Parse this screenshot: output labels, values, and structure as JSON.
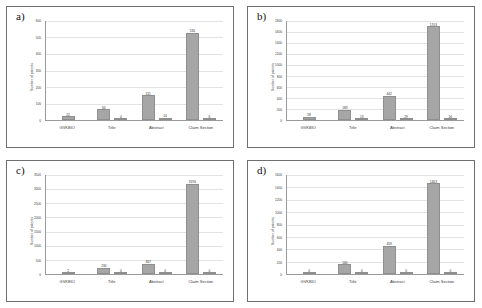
{
  "figure": {
    "panel_count": 4,
    "bar_color": "#a6a6a6",
    "gridline_color": "#e3e3e3",
    "axis_color": "#9a9a9a",
    "border_color": "#6f6f6f"
  },
  "chart_data": [
    {
      "type": "bar",
      "panel_label": "a)",
      "title": "",
      "xlabel": "",
      "ylabel": "Number of patents",
      "categories": [
        "GVKBIO",
        "Title",
        "Abstract",
        "Claim Section"
      ],
      "ylim": [
        0,
        600
      ],
      "yticks": [
        0,
        100,
        200,
        300,
        400,
        500,
        600
      ],
      "ytick_labels": [
        "0",
        "100",
        "200",
        "300",
        "400",
        "500",
        "600"
      ],
      "grid": true,
      "legend": "none",
      "series": [
        {
          "name": "series-1",
          "values": [
            22,
            64,
            151,
            530
          ]
        },
        {
          "name": "series-2",
          "values": [
            null,
            4,
            14,
            6
          ]
        }
      ],
      "data_labels": [
        {
          "category": "GVKBIO",
          "primary": "22",
          "secondary": ""
        },
        {
          "category": "Title",
          "primary": "64",
          "secondary": "4"
        },
        {
          "category": "Abstract",
          "primary": "151",
          "secondary": "14"
        },
        {
          "category": "Claim Section",
          "primary": "530",
          "secondary": "6"
        }
      ]
    },
    {
      "type": "bar",
      "panel_label": "b)",
      "title": "",
      "xlabel": "",
      "ylabel": "Number of patents",
      "categories": [
        "GVKBIO",
        "Title",
        "Abstract",
        "Claim Section"
      ],
      "ylim": [
        0,
        1800
      ],
      "yticks": [
        0,
        200,
        400,
        600,
        800,
        1000,
        1200,
        1400,
        1600,
        1800
      ],
      "ytick_labels": [
        "0",
        "200",
        "400",
        "600",
        "800",
        "1000",
        "1200",
        "1400",
        "1600",
        "1800"
      ],
      "grid": true,
      "legend": "none",
      "series": [
        {
          "name": "series-1",
          "values": [
            58,
            183,
            442,
            1703
          ]
        },
        {
          "name": "series-2",
          "values": [
            null,
            13,
            29,
            16
          ]
        }
      ],
      "data_labels": [
        {
          "category": "GVKBIO",
          "primary": "58",
          "secondary": ""
        },
        {
          "category": "Title",
          "primary": "183",
          "secondary": "13"
        },
        {
          "category": "Abstract",
          "primary": "442",
          "secondary": "29"
        },
        {
          "category": "Claim Section",
          "primary": "1703",
          "secondary": "16"
        }
      ]
    },
    {
      "type": "bar",
      "panel_label": "c)",
      "title": "",
      "xlabel": "",
      "ylabel": "Number of patents",
      "categories": [
        "GVKBIO",
        "Title",
        "Abstract",
        "Claim Section"
      ],
      "ylim": [
        0,
        3500
      ],
      "yticks": [
        0,
        500,
        1000,
        1500,
        2000,
        2500,
        3000,
        3500
      ],
      "ytick_labels": [
        "0",
        "500",
        "1000",
        "1500",
        "2000",
        "2500",
        "3000",
        "3500"
      ],
      "grid": true,
      "legend": "none",
      "series": [
        {
          "name": "series-1",
          "values": [
            2,
            230,
            367,
            3196
          ]
        },
        {
          "name": "series-2",
          "values": [
            null,
            0,
            0,
            0
          ]
        }
      ],
      "data_labels": [
        {
          "category": "GVKBIO",
          "primary": "2",
          "secondary": ""
        },
        {
          "category": "Title",
          "primary": "230",
          "secondary": "0"
        },
        {
          "category": "Abstract",
          "primary": "367",
          "secondary": "0"
        },
        {
          "category": "Claim Section",
          "primary": "3196",
          "secondary": "0"
        }
      ]
    },
    {
      "type": "bar",
      "panel_label": "d)",
      "title": "",
      "xlabel": "",
      "ylabel": "Number of patents",
      "categories": [
        "GVKBIO",
        "Title",
        "Abstract",
        "Claim Section"
      ],
      "ylim": [
        0,
        1600
      ],
      "yticks": [
        0,
        200,
        400,
        600,
        800,
        1000,
        1200,
        1400,
        1600
      ],
      "ytick_labels": [
        "0",
        "200",
        "400",
        "600",
        "800",
        "1000",
        "1200",
        "1400",
        "1600"
      ],
      "grid": true,
      "legend": "none",
      "series": [
        {
          "name": "series-1",
          "values": [
            0,
            160,
            459,
            1463
          ]
        },
        {
          "name": "series-2",
          "values": [
            null,
            0,
            0,
            0
          ]
        }
      ],
      "data_labels": [
        {
          "category": "GVKBIO",
          "primary": "0",
          "secondary": ""
        },
        {
          "category": "Title",
          "primary": "160",
          "secondary": "0"
        },
        {
          "category": "Abstract",
          "primary": "459",
          "secondary": "0"
        },
        {
          "category": "Claim Section",
          "primary": "1463",
          "secondary": "0"
        }
      ]
    }
  ]
}
